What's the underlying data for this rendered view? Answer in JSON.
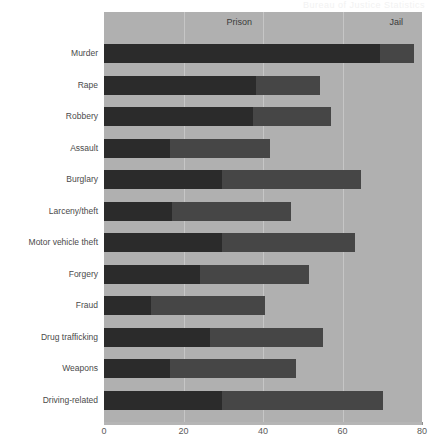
{
  "watermark": "Bureau of Justice Statistics",
  "chart_data": {
    "type": "bar",
    "orientation": "horizontal",
    "stacked": true,
    "title": "",
    "subtitle": "",
    "xlabel": "",
    "ylabel": "",
    "xlim": [
      0,
      80
    ],
    "xticks": [
      0,
      20,
      40,
      60,
      80
    ],
    "xticklabels": [
      "0",
      "20",
      "40",
      "60",
      "80"
    ],
    "grid": true,
    "grid_axis": "x",
    "legend_position": "top-inside",
    "categories": [
      "Murder",
      "Rape",
      "Robbery",
      "Assault",
      "Burglary",
      "Larceny/theft",
      "Motor vehicle theft",
      "Forgery",
      "Fraud",
      "Drug trafficking",
      "Weapons",
      "Driving-related"
    ],
    "series": [
      {
        "name": "Prison",
        "color": "#2b2b2b",
        "values": [
          69.4,
          38.2,
          37.5,
          16.6,
          29.7,
          17.1,
          29.7,
          24.1,
          11.8,
          26.7,
          16.6,
          29.7
        ]
      },
      {
        "name": "Jail",
        "color": "#464646",
        "values": [
          8.6,
          16.1,
          19.6,
          25.1,
          35.0,
          29.9,
          33.4,
          27.5,
          28.7,
          28.4,
          31.7,
          40.5
        ]
      }
    ],
    "totals": [
      78.0,
      54.3,
      57.1,
      41.7,
      64.7,
      47.0,
      63.1,
      51.6,
      40.5,
      55.1,
      48.3,
      70.2
    ],
    "legend_labels": [
      "Prison",
      "Jail"
    ],
    "panel_background": "#b0b0b0",
    "gridline_color": "#c6c6c6"
  }
}
